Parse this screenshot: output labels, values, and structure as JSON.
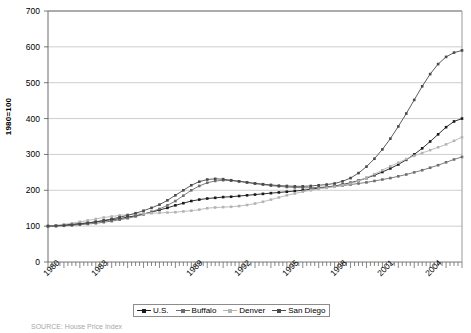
{
  "figure": {
    "source_note": "SOURCE: House Price Index"
  },
  "axes": {
    "ylabel": "1980=100",
    "yticks": [
      "0",
      "100",
      "200",
      "300",
      "400",
      "500",
      "600",
      "700"
    ],
    "xticks": [
      "1980",
      "1983",
      "1989",
      "1992",
      "1995",
      "1998",
      "2001",
      "2004"
    ]
  },
  "legend": {
    "items": [
      {
        "label": "U.S.",
        "color": "#1a1a1a",
        "marker": "square"
      },
      {
        "label": "Buffalo",
        "color": "#6e6e6e",
        "marker": "square"
      },
      {
        "label": "Denver",
        "color": "#b4b4b4",
        "marker": "square"
      },
      {
        "label": "San Diego",
        "color": "#4a4a4a",
        "marker": "square"
      }
    ]
  },
  "chart_data": {
    "type": "line",
    "title": "",
    "xlabel": "",
    "ylabel": "1980=100",
    "xlim": [
      1980,
      2006
    ],
    "ylim": [
      0,
      700
    ],
    "grid": true,
    "legend_position": "bottom",
    "x": [
      1980,
      1980.5,
      1981,
      1981.5,
      1982,
      1982.5,
      1983,
      1983.5,
      1984,
      1984.5,
      1985,
      1985.5,
      1986,
      1986.5,
      1987,
      1987.5,
      1988,
      1988.5,
      1989,
      1989.5,
      1990,
      1990.5,
      1991,
      1991.5,
      1992,
      1992.5,
      1993,
      1993.5,
      1994,
      1994.5,
      1995,
      1995.5,
      1996,
      1996.5,
      1997,
      1997.5,
      1998,
      1998.5,
      1999,
      1999.5,
      2000,
      2000.5,
      2001,
      2001.5,
      2002,
      2002.5,
      2003,
      2003.5,
      2004,
      2004.5,
      2005,
      2005.5,
      2006
    ],
    "series": [
      {
        "name": "U.S.",
        "color": "#1a1a1a",
        "values": [
          100,
          101,
          103,
          105,
          107,
          109,
          112,
          115,
          118,
          121,
          125,
          129,
          134,
          139,
          145,
          151,
          158,
          164,
          170,
          174,
          177,
          179,
          181,
          182,
          184,
          186,
          188,
          190,
          192,
          194,
          196,
          198,
          200,
          203,
          206,
          209,
          212,
          216,
          221,
          227,
          234,
          242,
          251,
          261,
          272,
          285,
          300,
          317,
          336,
          356,
          376,
          392,
          400
        ]
      },
      {
        "name": "Buffalo",
        "color": "#6e6e6e",
        "values": [
          100,
          100,
          101,
          102,
          104,
          106,
          108,
          111,
          114,
          118,
          122,
          127,
          133,
          140,
          148,
          158,
          170,
          185,
          200,
          212,
          221,
          226,
          228,
          227,
          225,
          222,
          219,
          216,
          213,
          211,
          209,
          208,
          207,
          207,
          208,
          209,
          211,
          213,
          216,
          219,
          222,
          226,
          230,
          234,
          239,
          244,
          250,
          256,
          263,
          270,
          278,
          286,
          293
        ]
      },
      {
        "name": "Denver",
        "color": "#b4b4b4",
        "values": [
          100,
          102,
          105,
          108,
          112,
          116,
          120,
          124,
          127,
          130,
          132,
          134,
          135,
          136,
          137,
          138,
          139,
          141,
          143,
          146,
          150,
          152,
          153,
          154,
          156,
          159,
          163,
          168,
          174,
          180,
          186,
          191,
          196,
          200,
          204,
          207,
          210,
          214,
          219,
          226,
          235,
          245,
          256,
          267,
          277,
          287,
          296,
          304,
          312,
          320,
          328,
          338,
          348
        ]
      },
      {
        "name": "San Diego",
        "color": "#4a4a4a",
        "values": [
          100,
          101,
          102,
          104,
          106,
          109,
          112,
          116,
          120,
          125,
          130,
          136,
          143,
          151,
          160,
          172,
          186,
          200,
          214,
          224,
          230,
          232,
          231,
          228,
          225,
          222,
          219,
          217,
          215,
          213,
          212,
          211,
          211,
          212,
          214,
          216,
          219,
          225,
          234,
          248,
          266,
          288,
          314,
          344,
          378,
          414,
          452,
          490,
          524,
          552,
          572,
          584,
          590
        ]
      }
    ]
  }
}
